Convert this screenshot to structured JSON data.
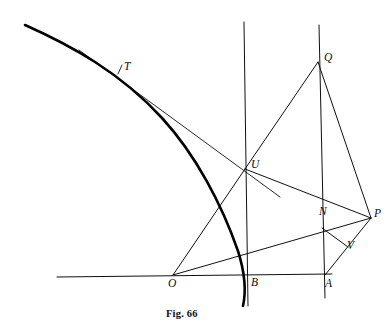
{
  "figure": {
    "caption": "Fig. 66",
    "caption_position": {
      "x": 166,
      "y": 308
    },
    "background_color": "#ffffff",
    "ink_color": "#101010",
    "thick_curve_color": "#000000",
    "width": 390,
    "height": 330
  },
  "points": [
    {
      "id": "T",
      "label": "T",
      "x": 120,
      "y": 70,
      "label_x": 124,
      "label_y": 61
    },
    {
      "id": "Q",
      "label": "Q",
      "x": 318,
      "y": 62,
      "label_x": 324,
      "label_y": 52
    },
    {
      "id": "U",
      "label": "U",
      "x": 245,
      "y": 169,
      "label_x": 251,
      "label_y": 159
    },
    {
      "id": "N",
      "label": "N",
      "x": 322,
      "y": 228,
      "label_x": 319,
      "label_y": 206
    },
    {
      "id": "P",
      "label": "P",
      "x": 371,
      "y": 218,
      "label_x": 374,
      "label_y": 208
    },
    {
      "id": "V",
      "label": "V",
      "x": 348,
      "y": 247,
      "label_x": 347,
      "label_y": 240
    },
    {
      "id": "O",
      "label": "O",
      "x": 173,
      "y": 275,
      "label_x": 168,
      "label_y": 278
    },
    {
      "id": "B",
      "label": "B",
      "x": 247,
      "y": 275,
      "label_x": 251,
      "label_y": 277
    },
    {
      "id": "A",
      "label": "A",
      "x": 325,
      "y": 275,
      "label_x": 325,
      "label_y": 278
    }
  ],
  "segments": [
    {
      "name": "baseline-horizontal",
      "x1": 57,
      "y1": 277,
      "x2": 332,
      "y2": 274,
      "width": 1.0
    },
    {
      "name": "vertical-through-U-B",
      "x1": 244,
      "y1": 22,
      "x2": 248,
      "y2": 306,
      "width": 1.0
    },
    {
      "name": "vertical-through-Q-N-A",
      "x1": 319,
      "y1": 25,
      "x2": 325,
      "y2": 298,
      "width": 1.0
    },
    {
      "name": "tangent-line-T-U",
      "x1": 79,
      "y1": 50,
      "x2": 280,
      "y2": 197,
      "width": 0.9
    },
    {
      "name": "chord-O-U",
      "x1": 173,
      "y1": 275,
      "x2": 245,
      "y2": 169,
      "width": 1.0
    },
    {
      "name": "chord-O-N-P",
      "x1": 173,
      "y1": 275,
      "x2": 371,
      "y2": 218,
      "width": 1.0
    },
    {
      "name": "chord-U-Q",
      "x1": 245,
      "y1": 169,
      "x2": 318,
      "y2": 62,
      "width": 1.0
    },
    {
      "name": "chord-U-P",
      "x1": 245,
      "y1": 169,
      "x2": 371,
      "y2": 218,
      "width": 1.0
    },
    {
      "name": "chord-Q-P",
      "x1": 318,
      "y1": 62,
      "x2": 371,
      "y2": 218,
      "width": 1.0
    },
    {
      "name": "chord-N-V",
      "x1": 322,
      "y1": 228,
      "x2": 348,
      "y2": 247,
      "width": 1.0
    },
    {
      "name": "chord-A-V-P",
      "x1": 325,
      "y1": 275,
      "x2": 371,
      "y2": 218,
      "width": 1.0
    },
    {
      "name": "tick-at-T",
      "x1": 118,
      "y1": 74,
      "x2": 122,
      "y2": 65,
      "width": 0.9
    }
  ],
  "curve": {
    "name": "hyperbola-branch",
    "path": "M 25 25 C 70 45 120 72 162 118 C 196 155 222 205 238 251 C 244 270 247 288 243 306",
    "width": 2.6,
    "color": "#000000"
  },
  "labels": {
    "T": "T",
    "Q": "Q",
    "U": "U",
    "N": "N",
    "P": "P",
    "V": "V",
    "O": "O",
    "B": "B",
    "A": "A"
  }
}
